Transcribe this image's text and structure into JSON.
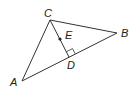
{
  "diagram": {
    "type": "geometry-triangle",
    "colors": {
      "stroke": "#333333",
      "label": "#222222",
      "background": "#ffffff"
    },
    "points": {
      "A": {
        "label": "A",
        "x": 22,
        "y": 81
      },
      "B": {
        "label": "B",
        "x": 117,
        "y": 33
      },
      "C": {
        "label": "C",
        "x": 50,
        "y": 20
      },
      "D": {
        "label": "D",
        "x": 69,
        "y": 57
      },
      "E": {
        "label": "E",
        "x": 60,
        "y": 39
      }
    },
    "segments": [
      "AC",
      "CB",
      "AB",
      "CD"
    ],
    "right_angle_at": "D",
    "marked_point": "E"
  }
}
